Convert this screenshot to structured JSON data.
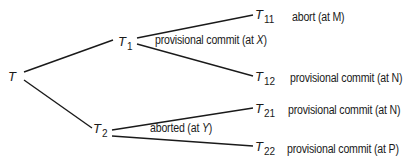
{
  "diagram": {
    "type": "transaction-tree",
    "root": {
      "label": "T"
    },
    "nodes": [
      {
        "id": "T1",
        "base": "T",
        "sub": "1"
      },
      {
        "id": "T2",
        "base": "T",
        "sub": "2"
      },
      {
        "id": "T11",
        "base": "T",
        "sub": "11"
      },
      {
        "id": "T12",
        "base": "T",
        "sub": "12"
      },
      {
        "id": "T21",
        "base": "T",
        "sub": "21"
      },
      {
        "id": "T22",
        "base": "T",
        "sub": "22"
      }
    ],
    "edges": [
      {
        "from": "T",
        "to": "T1"
      },
      {
        "from": "T",
        "to": "T2"
      },
      {
        "from": "T1",
        "to": "T11"
      },
      {
        "from": "T1",
        "to": "T12"
      },
      {
        "from": "T2",
        "to": "T21"
      },
      {
        "from": "T2",
        "to": "T22"
      }
    ],
    "edge_labels": {
      "T1": {
        "pre": "provisional commit (at ",
        "var": "X",
        "post": ")"
      },
      "T2": {
        "pre": "aborted (at ",
        "var": "Y",
        "post": ")"
      }
    },
    "leaf_status": {
      "T11": "abort (at M)",
      "T12": "provisional commit (at N)",
      "T21": "provisional commit (at N)",
      "T22": "provisional commit (at P)"
    }
  }
}
